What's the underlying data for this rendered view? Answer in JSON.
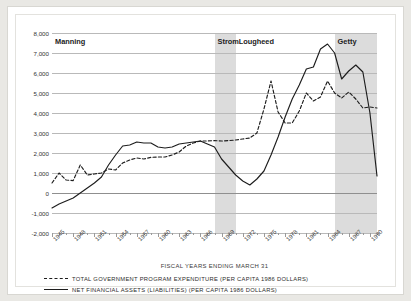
{
  "chart_data": {
    "type": "line",
    "title": "",
    "xlabel": "FISCAL YEARS ENDING MARCH 31",
    "ylabel": "",
    "ylim": [
      -2000,
      8000
    ],
    "xlim": [
      1945,
      1991
    ],
    "grid": true,
    "legend_position": "bottom-left",
    "yticks": [
      "8,000",
      "7,000",
      "6,000",
      "5,000",
      "4,000",
      "3,000",
      "2,000",
      "1,000",
      "0",
      "-1,000",
      "-2,000"
    ],
    "ytick_values": [
      8000,
      7000,
      6000,
      5000,
      4000,
      3000,
      2000,
      1000,
      0,
      -1000,
      -2000
    ],
    "xticks": [
      "1945",
      "1948",
      "1951",
      "1954",
      "1957",
      "1960",
      "1963",
      "1966",
      "1969",
      "1972",
      "1975",
      "1978",
      "1981",
      "1984",
      "1987",
      "1990"
    ],
    "xtick_values": [
      1945,
      1948,
      1951,
      1954,
      1957,
      1960,
      1963,
      1966,
      1969,
      1972,
      1975,
      1978,
      1981,
      1984,
      1987,
      1990
    ],
    "annotations": [
      {
        "label": "Manning",
        "start": 1945,
        "end": 1968,
        "shaded": false
      },
      {
        "label": "Strom",
        "start": 1968,
        "end": 1971,
        "shaded": true
      },
      {
        "label": "Lougheed",
        "start": 1971,
        "end": 1985,
        "shaded": false
      },
      {
        "label": "Getty",
        "start": 1985,
        "end": 1991,
        "shaded": true
      }
    ],
    "x": [
      1945,
      1946,
      1947,
      1948,
      1949,
      1950,
      1951,
      1952,
      1953,
      1954,
      1955,
      1956,
      1957,
      1958,
      1959,
      1960,
      1961,
      1962,
      1963,
      1964,
      1965,
      1966,
      1967,
      1968,
      1969,
      1970,
      1971,
      1972,
      1973,
      1974,
      1975,
      1976,
      1977,
      1978,
      1979,
      1980,
      1981,
      1982,
      1983,
      1984,
      1985,
      1986,
      1987,
      1988,
      1989,
      1990,
      1991
    ],
    "series": [
      {
        "name": "TOTAL GOVERNMENT PROGRAM EXPENDITURE (PER CAPITA 1986 DOLLARS)",
        "style": "dashed",
        "color": "#1d1d1d",
        "values": [
          500,
          1000,
          650,
          620,
          1400,
          900,
          950,
          1000,
          1200,
          1150,
          1500,
          1650,
          1750,
          1700,
          1780,
          1800,
          1800,
          1900,
          2050,
          2350,
          2500,
          2600,
          2600,
          2620,
          2600,
          2620,
          2650,
          2700,
          2750,
          3000,
          4200,
          5600,
          4050,
          3500,
          3500,
          4100,
          5000,
          4600,
          4800,
          5600,
          5000,
          4750,
          5050,
          4700,
          4250,
          4300,
          4250
        ]
      },
      {
        "name": "NET FINANCIAL ASSETS (LIABILITIES)  (PER CAPITA 1986 DOLLARS)",
        "style": "solid",
        "color": "#1d1d1d",
        "values": [
          -750,
          -550,
          -400,
          -250,
          0,
          250,
          500,
          800,
          1400,
          1900,
          2350,
          2400,
          2550,
          2500,
          2500,
          2300,
          2250,
          2300,
          2450,
          2500,
          2550,
          2600,
          2450,
          2300,
          1700,
          1300,
          900,
          600,
          400,
          700,
          1100,
          1900,
          2800,
          3800,
          4700,
          5400,
          6200,
          6300,
          7200,
          7450,
          7000,
          5700,
          6100,
          6400,
          6050,
          4000,
          850
        ]
      }
    ]
  },
  "legend": {
    "items": [
      {
        "label": "TOTAL GOVERNMENT PROGRAM EXPENDITURE (PER CAPITA 1986 DOLLARS)",
        "style": "dashed"
      },
      {
        "label": "NET FINANCIAL ASSETS (LIABILITIES)  (PER CAPITA 1986 DOLLARS)",
        "style": "solid"
      }
    ]
  }
}
